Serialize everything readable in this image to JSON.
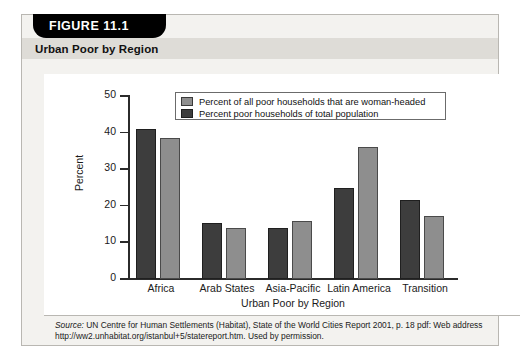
{
  "figure": {
    "tab_label": "FIGURE 11.1",
    "title": "Urban Poor by Region",
    "source_lead": "Source:",
    "source_text": " UN Centre for Human Settlements (Habitat), State of the World Cities Report 2001, p. 18 pdf: Web address http://ww2.unhabitat.org/istanbul+5/statereport.htm. Used by permission."
  },
  "colors": {
    "series_light": "#8e8e8e",
    "series_dark": "#3d3d3d",
    "card_background": "#f3f2ef",
    "title_band": "#dedcd7",
    "tab_background": "#000000",
    "axis": "#2b2b2b"
  },
  "chart_data": {
    "type": "bar",
    "title": "Urban Poor by Region",
    "xlabel": "Urban Poor by Region",
    "ylabel": "Percent",
    "ylim": [
      0,
      50
    ],
    "yticks": [
      0,
      10,
      20,
      30,
      40,
      50
    ],
    "grid": false,
    "legend_position": "top-center-inside",
    "categories": [
      "Africa",
      "Arab States",
      "Asia-Pacific",
      "Latin America",
      "Transition"
    ],
    "series": [
      {
        "name": "Percent poor households of total population",
        "color": "#3d3d3d",
        "values": [
          41,
          15.3,
          13.9,
          25,
          21.5
        ]
      },
      {
        "name": "Percent of all poor households that are woman-headed",
        "color": "#8e8e8e",
        "values": [
          38.5,
          14,
          15.9,
          36,
          17.2
        ]
      }
    ],
    "legend_entries": [
      "Percent of all poor households that are woman-headed",
      "Percent poor households of total population"
    ]
  }
}
